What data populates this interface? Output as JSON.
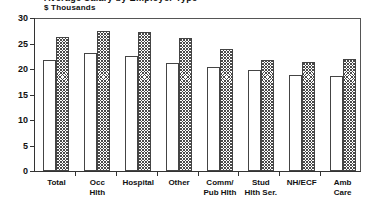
{
  "chart": {
    "clipped_title": "Average Salary by Employer Type",
    "axis_unit_label": "$ Thousands"
  },
  "chart_data": {
    "type": "bar",
    "title": "",
    "xlabel": "",
    "ylabel": "$ Thousands",
    "ylim": [
      0,
      30
    ],
    "yticks": [
      0,
      5,
      10,
      15,
      20,
      25,
      30
    ],
    "grid": false,
    "legend": "none",
    "categories": [
      "Total",
      "Occ\nHlth",
      "Hospital",
      "Other",
      "Comm/\nPub Hlth",
      "Stud\nHlth Ser.",
      "NH/ECF",
      "Amb\nCare"
    ],
    "series": [
      {
        "name": "Series 1",
        "style": "open",
        "values": [
          21.7,
          23.1,
          22.5,
          21.1,
          20.4,
          19.9,
          18.8,
          18.7
        ]
      },
      {
        "name": "Series 2",
        "style": "hatched",
        "values": [
          26.3,
          27.5,
          27.3,
          26.0,
          23.9,
          21.7,
          21.4,
          21.9
        ]
      }
    ]
  },
  "colors": {
    "axis": "#333333",
    "frame": "#555555",
    "bar_outline": "#444444",
    "bar_open_fill": "#ffffff",
    "bar_hatch_ink": "#4a4a4a",
    "text": "#111111",
    "background": "#ffffff"
  }
}
